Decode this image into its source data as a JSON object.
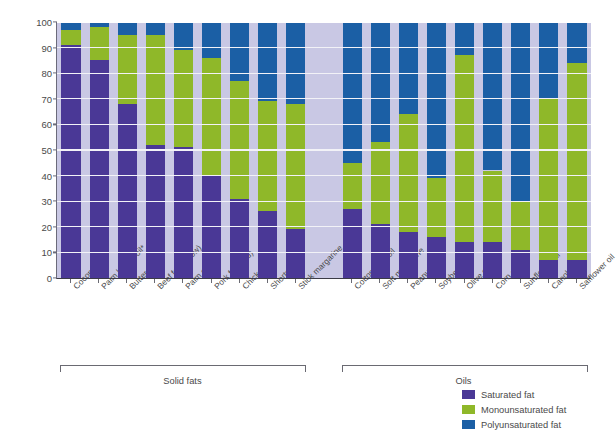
{
  "chart_data": {
    "type": "bar",
    "stacked": true,
    "title": "",
    "xlabel": "",
    "ylabel": "Fatty acid composition (% of total)",
    "ylim": [
      0,
      100
    ],
    "yticks": [
      0,
      10,
      20,
      30,
      40,
      50,
      60,
      70,
      80,
      90,
      100
    ],
    "grid": true,
    "legend_position": "bottom-right",
    "categories": [
      "Coconut oil*",
      "Palm kernel oil*",
      "Butter",
      "Beef fat (tallow)",
      "Palm oil*",
      "Pork fat (lard)",
      "Chicken fat",
      "Shortening",
      "Stick margarine",
      "Cottonseed oil",
      "Soft margarine",
      "Peanut oil",
      "Soybean oil",
      "Olive oil",
      "Corn oil",
      "Sunflower oil",
      "Canola oil",
      "Safflower oil"
    ],
    "series": [
      {
        "name": "Saturated fat",
        "color": "#4a3896",
        "values": [
          91,
          85,
          68,
          52,
          51,
          40,
          31,
          26,
          19,
          27,
          21,
          18,
          16,
          14,
          14,
          11,
          7,
          7
        ]
      },
      {
        "name": "Monounsaturated fat",
        "color": "#8fb829",
        "values": [
          6,
          13,
          27,
          43,
          38,
          46,
          46,
          43,
          49,
          18,
          32,
          46,
          23,
          73,
          28,
          19,
          63,
          77
        ]
      },
      {
        "name": "Polyunsaturated fat",
        "color": "#1b5fa5",
        "values": [
          3,
          2,
          5,
          5,
          11,
          14,
          23,
          31,
          32,
          55,
          47,
          36,
          61,
          13,
          58,
          70,
          30,
          16
        ]
      }
    ],
    "groups": [
      {
        "label": "Solid fats",
        "start_index": 0,
        "end_index": 8
      },
      {
        "label": "Oils",
        "start_index": 9,
        "end_index": 17
      }
    ]
  },
  "legend": {
    "items": [
      {
        "label": "Saturated fat",
        "color": "#4a3896"
      },
      {
        "label": "Monounsaturated fat",
        "color": "#8fb829"
      },
      {
        "label": "Polyunsaturated fat",
        "color": "#1b5fa5"
      }
    ]
  },
  "axis": {
    "y_title": "Fatty acid composition (% of total)",
    "y_tick_labels": [
      "0",
      "10",
      "20",
      "30",
      "40",
      "50",
      "60",
      "70",
      "80",
      "90",
      "100"
    ]
  },
  "colors": {
    "saturated": "#4a3896",
    "monounsaturated": "#8fb829",
    "polyunsaturated": "#1b5fa5",
    "plot_background": "#c9c8e4",
    "gridline": "#f2f2f7",
    "text": "#4a4a4a"
  }
}
